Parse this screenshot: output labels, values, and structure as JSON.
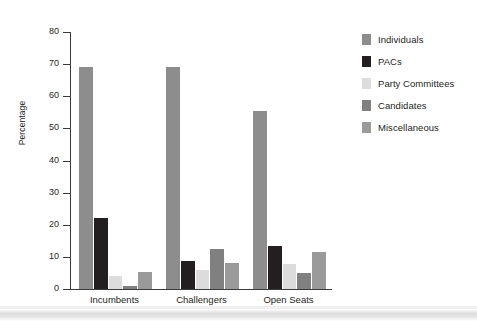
{
  "chart_data": {
    "type": "bar",
    "title": "",
    "xlabel": "",
    "ylabel": "Percentage",
    "ylim": [
      0,
      80
    ],
    "yticks": [
      0,
      10,
      20,
      30,
      40,
      50,
      60,
      70,
      80
    ],
    "grid": false,
    "legend_position": "right",
    "categories": [
      "Incumbents",
      "Challengers",
      "Open Seats"
    ],
    "series": [
      {
        "name": "Individuals",
        "color": "#8d8d8d",
        "values": [
          69.0,
          69.2,
          55.3
        ]
      },
      {
        "name": "PACs",
        "color": "#231f20",
        "values": [
          22.2,
          8.8,
          13.4
        ]
      },
      {
        "name": "Party Committees",
        "color": "#dcdcdc",
        "values": [
          4.0,
          6.0,
          7.9
        ]
      },
      {
        "name": "Candidates",
        "color": "#808080",
        "values": [
          1.0,
          12.5,
          5.1
        ]
      },
      {
        "name": "Miscellaneous",
        "color": "#9a9a9a",
        "values": [
          5.3,
          8.1,
          11.5
        ]
      }
    ]
  },
  "axis": {
    "y_title": "Percentage",
    "tick_labels": [
      "0",
      "10",
      "20",
      "30",
      "40",
      "50",
      "60",
      "70",
      "80"
    ]
  },
  "legend": {
    "items": [
      {
        "label": "Individuals"
      },
      {
        "label": "PACs"
      },
      {
        "label": "Party Committees"
      },
      {
        "label": "Candidates"
      },
      {
        "label": "Miscellaneous"
      }
    ]
  }
}
